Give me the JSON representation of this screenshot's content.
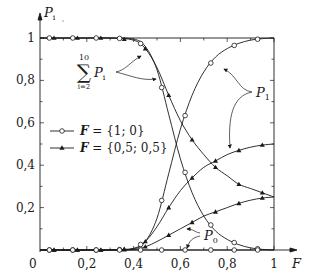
{
  "chart_data": {
    "type": "line",
    "title": "",
    "ylabel": "P_i",
    "xlabel": "F",
    "xlim": [
      0,
      1
    ],
    "ylim": [
      0,
      1
    ],
    "grid": false,
    "x_ticks": [
      "0",
      "0,2",
      "0,4",
      "0,6",
      "0,8",
      "1"
    ],
    "y_ticks": [
      "0,2",
      "0,4",
      "0,6",
      "0,8",
      "1"
    ],
    "legend": [
      {
        "label": "F = {1;0}",
        "marker": "circle"
      },
      {
        "label": "F = {0,5;0,5}",
        "marker": "triangle"
      }
    ],
    "legend_position": "middle-left",
    "annotations": [
      {
        "text": "Σ_{i=2}^{10} P_i",
        "points_to": "sum curves near F≈0.45–0.5"
      },
      {
        "text": "P_1",
        "points_to": "P1 curves near F≈0.75–0.8"
      },
      {
        "text": "P_0",
        "points_to": "P0 curves near F≈0.6–0.65"
      }
    ],
    "series": [
      {
        "name": "Sum P_i (i=2..10), F={1;0}",
        "marker": "circle",
        "x": [
          0,
          0.1,
          0.2,
          0.3,
          0.4,
          0.45,
          0.5,
          0.55,
          0.6,
          0.65,
          0.7,
          0.75,
          0.8,
          0.85,
          0.9,
          0.95,
          1.0
        ],
        "y": [
          1,
          1,
          1,
          1,
          0.995,
          0.96,
          0.85,
          0.64,
          0.43,
          0.27,
          0.16,
          0.09,
          0.05,
          0.025,
          0.01,
          0.003,
          0
        ]
      },
      {
        "name": "P_1, F={1;0}",
        "marker": "circle",
        "x": [
          0,
          0.1,
          0.2,
          0.3,
          0.4,
          0.45,
          0.5,
          0.55,
          0.6,
          0.65,
          0.7,
          0.75,
          0.8,
          0.85,
          0.9,
          0.95,
          1.0
        ],
        "y": [
          0,
          0,
          0,
          0,
          0.005,
          0.04,
          0.15,
          0.36,
          0.57,
          0.73,
          0.84,
          0.91,
          0.95,
          0.975,
          0.99,
          0.997,
          1
        ]
      },
      {
        "name": "P_0, F={1;0}",
        "marker": "circle",
        "x": [
          0,
          0.2,
          0.4,
          0.6,
          0.8,
          1.0
        ],
        "y": [
          0,
          0,
          0,
          0,
          0,
          0
        ]
      },
      {
        "name": "Sum P_i (i=2..10), F={0,5;0,5}",
        "marker": "triangle",
        "x": [
          0,
          0.1,
          0.2,
          0.3,
          0.4,
          0.45,
          0.5,
          0.55,
          0.6,
          0.65,
          0.7,
          0.75,
          0.8,
          0.85,
          0.9,
          0.95,
          1.0
        ],
        "y": [
          1,
          1,
          1,
          1,
          0.99,
          0.95,
          0.86,
          0.73,
          0.61,
          0.52,
          0.45,
          0.39,
          0.35,
          0.31,
          0.29,
          0.27,
          0.25
        ]
      },
      {
        "name": "P_1, F={0,5;0,5}",
        "marker": "triangle",
        "x": [
          0,
          0.1,
          0.2,
          0.3,
          0.4,
          0.45,
          0.5,
          0.55,
          0.6,
          0.65,
          0.7,
          0.75,
          0.8,
          0.85,
          0.9,
          0.95,
          1.0
        ],
        "y": [
          0,
          0,
          0,
          0,
          0.008,
          0.04,
          0.11,
          0.2,
          0.28,
          0.34,
          0.39,
          0.42,
          0.45,
          0.47,
          0.485,
          0.495,
          0.5
        ]
      },
      {
        "name": "P_0, F={0,5;0,5}",
        "marker": "triangle",
        "x": [
          0,
          0.1,
          0.2,
          0.3,
          0.4,
          0.45,
          0.5,
          0.55,
          0.6,
          0.65,
          0.7,
          0.75,
          0.8,
          0.85,
          0.9,
          0.95,
          1.0
        ],
        "y": [
          0,
          0,
          0,
          0,
          0.003,
          0.015,
          0.04,
          0.07,
          0.1,
          0.13,
          0.16,
          0.18,
          0.2,
          0.22,
          0.235,
          0.245,
          0.25
        ]
      }
    ]
  },
  "labels": {
    "y_axis": "P",
    "y_axis_sub": "i",
    "x_axis": "F",
    "origin": "0",
    "x_tick_labels": [
      "0,2",
      "0,4",
      "0,6",
      "0,8",
      "1"
    ],
    "y_tick_labels": [
      "1",
      "0,8",
      "0,6",
      "0,4",
      "0,2"
    ],
    "legend_1": "F = {1;0}",
    "legend_2": "F = {0,5;0,5}",
    "legend_1_F": "F",
    "legend_1_rest": " = {1; 0}",
    "legend_2_F": "F",
    "legend_2_rest": " = {0,5; 0,5}",
    "sum_upper": "10",
    "sum_symbol": "∑",
    "sum_lower": "i=2",
    "sum_P": "P",
    "sum_sub": "i",
    "p1": "P",
    "p1_sub": "1",
    "p0": "P",
    "p0_sub": "0"
  }
}
